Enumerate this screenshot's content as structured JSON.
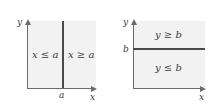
{
  "figure": {
    "background_color": "#ffffff",
    "region_fill_color": "#f2f2f2",
    "axis_color": "#6b6b6b",
    "boundary_color": "#4a4a4a",
    "text_color": "#3a3a3a"
  },
  "panels": [
    {
      "id": "left",
      "axis_labels": {
        "x": "x",
        "y": "y"
      },
      "tick_labels": {
        "x_axis": "a"
      },
      "boundary": {
        "orientation": "vertical",
        "label": "a",
        "equation": "x = a"
      },
      "regions": [
        {
          "position": "left",
          "label": "x ≤ a"
        },
        {
          "position": "right",
          "label": "x ≥ a"
        }
      ]
    },
    {
      "id": "right",
      "axis_labels": {
        "x": "x",
        "y": "y"
      },
      "tick_labels": {
        "y_axis": "b"
      },
      "boundary": {
        "orientation": "horizontal",
        "label": "b",
        "equation": "y = b"
      },
      "regions": [
        {
          "position": "top",
          "label": "y ≥ b"
        },
        {
          "position": "bottom",
          "label": "y ≤ b"
        }
      ]
    }
  ]
}
